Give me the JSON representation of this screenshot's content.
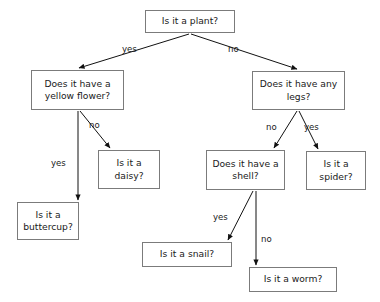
{
  "diagram": {
    "type": "decision-tree-flowchart",
    "background_color": "#ffffff",
    "border_color": "#7b7b7b",
    "text_color": "#1a1a1a",
    "nodes": [
      {
        "id": "plant",
        "text": "Is it a plant?",
        "x": 145,
        "y": 10,
        "w": 90,
        "h": 23,
        "kind": "question"
      },
      {
        "id": "yellowflower",
        "text": "Does it have a\nyellow flower?",
        "x": 31,
        "y": 70,
        "w": 93,
        "h": 40,
        "kind": "question"
      },
      {
        "id": "legs",
        "text": "Does it have any\nlegs?",
        "x": 252,
        "y": 71,
        "w": 93,
        "h": 39,
        "kind": "question"
      },
      {
        "id": "daisy",
        "text": "Is it a\ndaisy?",
        "x": 98,
        "y": 150,
        "w": 62,
        "h": 39,
        "kind": "answer"
      },
      {
        "id": "shell",
        "text": "Does it have a\nshell?",
        "x": 206,
        "y": 150,
        "w": 79,
        "h": 40,
        "kind": "question"
      },
      {
        "id": "spider",
        "text": "Is it a\nspider?",
        "x": 306,
        "y": 151,
        "w": 60,
        "h": 39,
        "kind": "answer"
      },
      {
        "id": "buttercup",
        "text": "Is it a\nbuttercup?",
        "x": 17,
        "y": 202,
        "w": 62,
        "h": 38,
        "kind": "answer"
      },
      {
        "id": "snail",
        "text": "Is it a snail?",
        "x": 142,
        "y": 242,
        "w": 90,
        "h": 25,
        "kind": "answer"
      },
      {
        "id": "worm",
        "text": "Is it a worm?",
        "x": 249,
        "y": 267,
        "w": 88,
        "h": 25,
        "kind": "answer"
      }
    ],
    "edges": [
      {
        "id": "plant-yes-yellowflower",
        "from": "plant",
        "to": "yellowflower",
        "label": "yes",
        "x1": 189,
        "y1": 34,
        "x2": 79,
        "y2": 68,
        "label_x": 122,
        "label_y": 44
      },
      {
        "id": "plant-no-legs",
        "from": "plant",
        "to": "legs",
        "label": "no",
        "x1": 191,
        "y1": 34,
        "x2": 297,
        "y2": 69,
        "label_x": 228,
        "label_y": 44
      },
      {
        "id": "yellowflower-yes-buttercup",
        "from": "yellowflower",
        "to": "buttercup",
        "label": "yes",
        "x1": 78,
        "y1": 111,
        "x2": 78,
        "y2": 200,
        "label_x": 51,
        "label_y": 158
      },
      {
        "id": "yellowflower-no-daisy",
        "from": "yellowflower",
        "to": "daisy",
        "label": "no",
        "x1": 80,
        "y1": 111,
        "x2": 110,
        "y2": 148,
        "label_x": 89,
        "label_y": 120
      },
      {
        "id": "legs-no-shell",
        "from": "legs",
        "to": "shell",
        "label": "no",
        "x1": 297,
        "y1": 111,
        "x2": 274,
        "y2": 148,
        "label_x": 266,
        "label_y": 122
      },
      {
        "id": "legs-yes-spider",
        "from": "legs",
        "to": "spider",
        "label": "yes",
        "x1": 299,
        "y1": 111,
        "x2": 318,
        "y2": 149,
        "label_x": 304,
        "label_y": 122
      },
      {
        "id": "shell-yes-snail",
        "from": "shell",
        "to": "snail",
        "label": "yes",
        "x1": 253,
        "y1": 191,
        "x2": 228,
        "y2": 240,
        "label_x": 213,
        "label_y": 212
      },
      {
        "id": "shell-no-worm",
        "from": "shell",
        "to": "worm",
        "label": "no",
        "x1": 256,
        "y1": 191,
        "x2": 256,
        "y2": 265,
        "label_x": 261,
        "label_y": 234
      }
    ]
  }
}
